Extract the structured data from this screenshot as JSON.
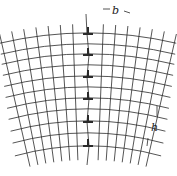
{
  "diagram": {
    "labels": {
      "spacing_b": "b",
      "spacing_h": "h"
    },
    "colors": {
      "line": "#2a2a2a",
      "background": "#ffffff"
    },
    "dislocation_symbol": "⊥",
    "dislocations_y": [
      34,
      55,
      77,
      99,
      122,
      146
    ],
    "dislocation_x": 88
  }
}
